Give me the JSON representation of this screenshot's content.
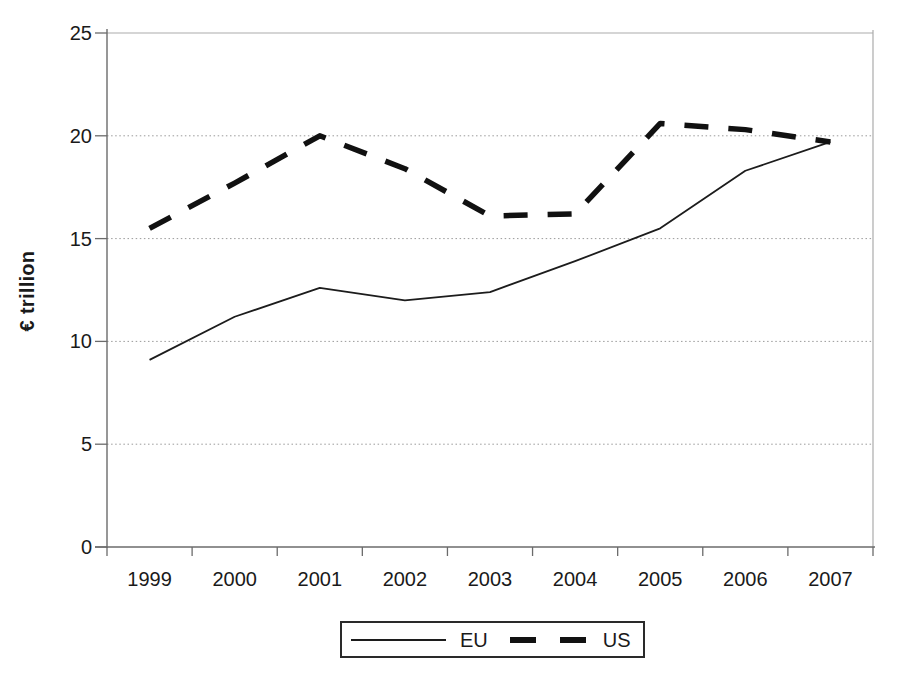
{
  "colors": {
    "background": "#ffffff",
    "axis": "#6b6b6b",
    "grid": "#9a9a9a",
    "grid_top": "#ababab",
    "text": "#1a1a1a",
    "legend_border": "#2a2a2a"
  },
  "chart_data": {
    "type": "line",
    "title": "",
    "xlabel": "",
    "ylabel": "€ trillion",
    "categories": [
      "1999",
      "2000",
      "2001",
      "2002",
      "2003",
      "2004",
      "2005",
      "2006",
      "2007"
    ],
    "ylim": [
      0,
      25
    ],
    "yticks": [
      0,
      5,
      10,
      15,
      20,
      25
    ],
    "grid": "horizontal dotted",
    "legend_position": "bottom-center",
    "series": [
      {
        "name": "EU",
        "style": "solid",
        "color": "#1c1c1c",
        "values": [
          9.1,
          11.2,
          12.6,
          12.0,
          12.4,
          13.9,
          15.5,
          18.3,
          19.7
        ]
      },
      {
        "name": "US",
        "style": "dashed",
        "color": "#111111",
        "values": [
          15.5,
          17.7,
          20.0,
          18.4,
          16.1,
          16.2,
          20.6,
          20.3,
          19.7
        ]
      }
    ]
  }
}
